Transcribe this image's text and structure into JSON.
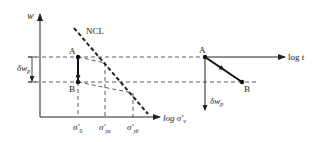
{
  "left_panel": {
    "y_axis_label": "w",
    "x_axis_label": "log σ′",
    "x_axis_label_sub": "v",
    "ncl_label": "NCL",
    "bracket_label": "δw",
    "bracket_label_sub": "p",
    "point_a_label": "A",
    "point_b_label": "B",
    "ticks": [
      {
        "main": "σ′",
        "sub": "0"
      },
      {
        "main": "σ′",
        "sub": "ya"
      },
      {
        "main": "σ′",
        "sub": "yb"
      }
    ]
  },
  "right_panel": {
    "x_axis_label": "log t",
    "y_axis_label": "δw",
    "y_axis_label_sub": "p",
    "point_a_label": "A",
    "point_b_label": "B"
  },
  "colors": {
    "line": "#222222",
    "dashed": "#333333",
    "background": "#ffffff"
  }
}
